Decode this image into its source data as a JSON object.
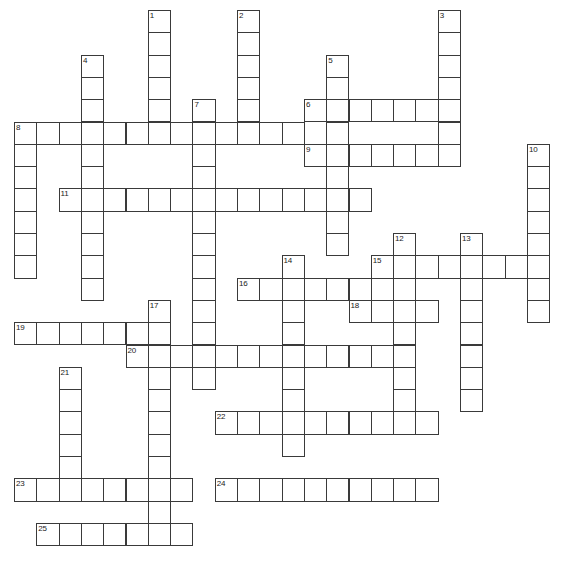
{
  "puzzle": {
    "title": "Crossword Puzzle Grid",
    "grid": {
      "origin_x": 14,
      "origin_y": 10,
      "cell_size": 22.3,
      "columns": 25,
      "rows": 25,
      "cell_fill": "#ffffff",
      "cell_border": "#3a3a3a",
      "background": "#ffffff"
    },
    "entries": [
      {
        "number": "1",
        "direction": "down",
        "row": 0,
        "col": 6,
        "length": 6
      },
      {
        "number": "2",
        "direction": "down",
        "row": 0,
        "col": 10,
        "length": 6
      },
      {
        "number": "3",
        "direction": "down",
        "row": 0,
        "col": 19,
        "length": 6
      },
      {
        "number": "4",
        "direction": "down",
        "row": 2,
        "col": 3,
        "length": 11
      },
      {
        "number": "5",
        "direction": "down",
        "row": 2,
        "col": 14,
        "length": 9
      },
      {
        "number": "6",
        "direction": "across",
        "row": 4,
        "col": 13,
        "length": 7
      },
      {
        "number": "7",
        "direction": "down",
        "row": 4,
        "col": 8,
        "length": 13
      },
      {
        "number": "8",
        "direction": "across",
        "row": 5,
        "col": 0,
        "length": 13
      },
      {
        "number": "8",
        "direction": "down",
        "row": 5,
        "col": 0,
        "length": 7
      },
      {
        "number": "9",
        "direction": "across",
        "row": 6,
        "col": 13,
        "length": 7
      },
      {
        "number": "10",
        "direction": "down",
        "row": 6,
        "col": 23,
        "length": 8
      },
      {
        "number": "11",
        "direction": "across",
        "row": 8,
        "col": 2,
        "length": 14
      },
      {
        "number": "12",
        "direction": "down",
        "row": 10,
        "col": 17,
        "length": 9
      },
      {
        "number": "13",
        "direction": "down",
        "row": 10,
        "col": 20,
        "length": 8
      },
      {
        "number": "14",
        "direction": "down",
        "row": 11,
        "col": 12,
        "length": 9
      },
      {
        "number": "15",
        "direction": "across",
        "row": 11,
        "col": 16,
        "length": 8
      },
      {
        "number": "16",
        "direction": "across",
        "row": 12,
        "col": 10,
        "length": 6
      },
      {
        "number": "17",
        "direction": "down",
        "row": 13,
        "col": 6,
        "length": 11
      },
      {
        "number": "18",
        "direction": "across",
        "row": 13,
        "col": 15,
        "length": 4
      },
      {
        "number": "19",
        "direction": "across",
        "row": 14,
        "col": 0,
        "length": 6
      },
      {
        "number": "20",
        "direction": "across",
        "row": 15,
        "col": 5,
        "length": 12
      },
      {
        "number": "21",
        "direction": "down",
        "row": 16,
        "col": 2,
        "length": 6
      },
      {
        "number": "22",
        "direction": "across",
        "row": 18,
        "col": 9,
        "length": 10
      },
      {
        "number": "23",
        "direction": "across",
        "row": 21,
        "col": 0,
        "length": 8
      },
      {
        "number": "24",
        "direction": "across",
        "row": 21,
        "col": 9,
        "length": 10
      },
      {
        "number": "25",
        "direction": "across",
        "row": 23,
        "col": 1,
        "length": 7
      }
    ],
    "numbered_cells": [
      {
        "label": "1",
        "row": 0,
        "col": 6
      },
      {
        "label": "2",
        "row": 0,
        "col": 10
      },
      {
        "label": "3",
        "row": 0,
        "col": 19
      },
      {
        "label": "4",
        "row": 2,
        "col": 3
      },
      {
        "label": "5",
        "row": 2,
        "col": 14
      },
      {
        "label": "6",
        "row": 4,
        "col": 13
      },
      {
        "label": "7",
        "row": 4,
        "col": 8
      },
      {
        "label": "8",
        "row": 5,
        "col": 0
      },
      {
        "label": "9",
        "row": 6,
        "col": 13
      },
      {
        "label": "10",
        "row": 6,
        "col": 23
      },
      {
        "label": "11",
        "row": 8,
        "col": 2
      },
      {
        "label": "12",
        "row": 10,
        "col": 17
      },
      {
        "label": "13",
        "row": 10,
        "col": 20
      },
      {
        "label": "14",
        "row": 11,
        "col": 12
      },
      {
        "label": "15",
        "row": 11,
        "col": 16
      },
      {
        "label": "16",
        "row": 12,
        "col": 10
      },
      {
        "label": "17",
        "row": 13,
        "col": 6
      },
      {
        "label": "18",
        "row": 13,
        "col": 15
      },
      {
        "label": "19",
        "row": 14,
        "col": 0
      },
      {
        "label": "20",
        "row": 15,
        "col": 5
      },
      {
        "label": "21",
        "row": 16,
        "col": 2
      },
      {
        "label": "22",
        "row": 18,
        "col": 9
      },
      {
        "label": "23",
        "row": 21,
        "col": 0
      },
      {
        "label": "24",
        "row": 21,
        "col": 9
      },
      {
        "label": "25",
        "row": 23,
        "col": 1
      }
    ]
  }
}
